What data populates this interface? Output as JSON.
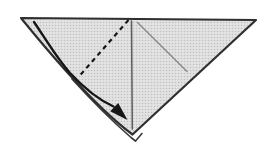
{
  "diagram": {
    "type": "origami-fold-step",
    "colors": {
      "background": "#ffffff",
      "paper_base": "#e3e3e3",
      "paper_dot": "#c0c0c0",
      "outline": "#2f2f2f",
      "layer_edge": "#3a3a3a",
      "crease_center": "#5c5c5c",
      "crease_diagonal": "#8a8a8a",
      "fold_dash": "#161616",
      "arrow": "#161616"
    }
  }
}
